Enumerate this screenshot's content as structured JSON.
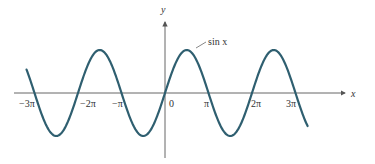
{
  "chart_data": {
    "type": "line",
    "title": "",
    "xlabel": "x",
    "ylabel": "y",
    "series": [
      {
        "name": "sin x",
        "function": "sin(x)",
        "x_range": [
          -10.0,
          10.3
        ]
      }
    ],
    "x_ticks": [
      {
        "value": -9.42478,
        "label": "−3π"
      },
      {
        "value": -6.28319,
        "label": "−2π"
      },
      {
        "value": -3.14159,
        "label": "−π"
      },
      {
        "value": 0,
        "label": "0"
      },
      {
        "value": 3.14159,
        "label": "π"
      },
      {
        "value": 6.28319,
        "label": "2π"
      },
      {
        "value": 9.42478,
        "label": "3π"
      }
    ],
    "xlim": [
      -10.6,
      11.2
    ],
    "ylim": [
      -1.6,
      1.7
    ],
    "grid": false,
    "legend": "none",
    "annotations": [
      {
        "text": "sin x",
        "x": 1.57,
        "y": 1.0
      }
    ]
  },
  "labels": {
    "x_axis": "x",
    "y_axis": "y",
    "curve": "sin x",
    "tick_neg3pi": "−3π",
    "tick_neg2pi": "−2π",
    "tick_negpi": "−π",
    "tick_zero": "0",
    "tick_pi": "π",
    "tick_2pi": "2π",
    "tick_3pi": "3π"
  },
  "colors": {
    "curve": "#2f5f70",
    "axis": "#555555"
  }
}
